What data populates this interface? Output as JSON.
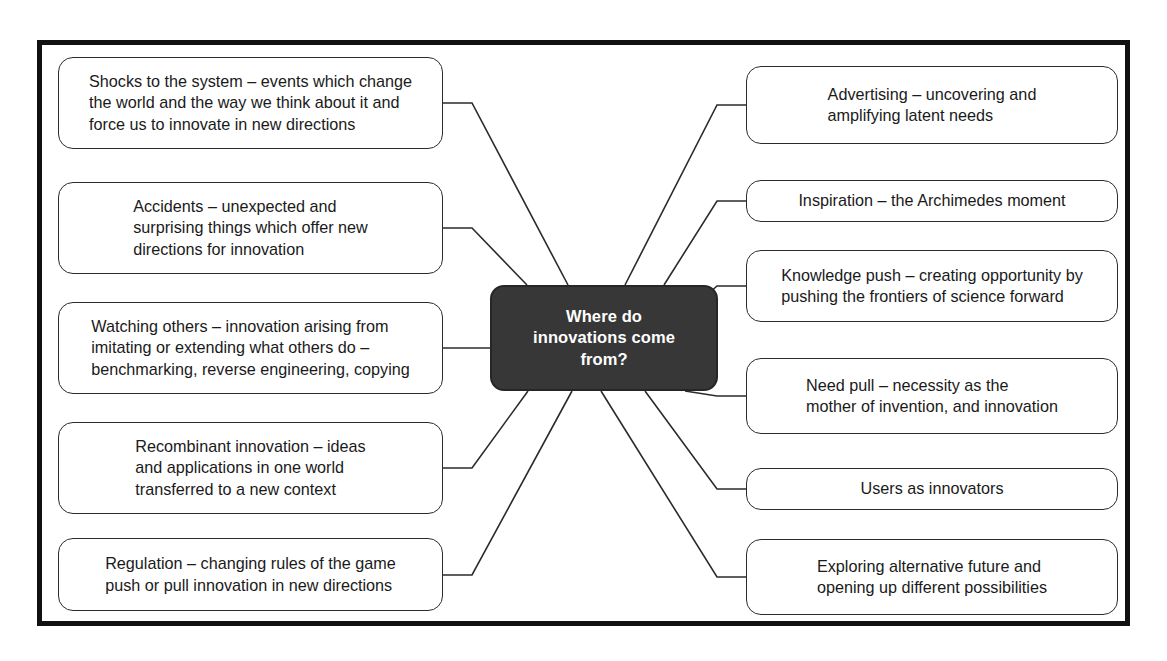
{
  "diagram": {
    "title": "Where do innovations come from?",
    "frame_color": "#111111",
    "node_border_color": "#2b2b2b",
    "center_fill_color": "#373737",
    "center_text_color": "#ffffff",
    "connector_color": "#2b2b2b"
  },
  "center": {
    "label": "Where do\ninnovations come\nfrom?"
  },
  "left_nodes": [
    {
      "id": "shocks-to-the-system",
      "label": "Shocks to the system – events which change\nthe world and the way we think about it and\nforce us to innovate in new directions",
      "align": "left"
    },
    {
      "id": "accidents",
      "label": "Accidents – unexpected and\nsurprising things which offer new\ndirections for innovation",
      "align": "left"
    },
    {
      "id": "watching-others",
      "label": "Watching others – innovation arising from\nimitating or extending what others do –\nbenchmarking, reverse engineering, copying",
      "align": "left"
    },
    {
      "id": "recombinant-innovation",
      "label": "Recombinant innovation – ideas\nand applications in one world\ntransferred to a new context",
      "align": "left"
    },
    {
      "id": "regulation",
      "label": "Regulation – changing rules of the game\npush or pull innovation in new directions",
      "align": "left"
    }
  ],
  "right_nodes": [
    {
      "id": "advertising",
      "label": "Advertising – uncovering and\namplifying latent needs",
      "align": "left"
    },
    {
      "id": "inspiration",
      "label": "Inspiration – the Archimedes moment",
      "align": "center"
    },
    {
      "id": "knowledge-push",
      "label": "Knowledge push – creating opportunity by\npushing the frontiers of science forward",
      "align": "left"
    },
    {
      "id": "need-pull",
      "label": "Need pull – necessity as the\nmother of invention, and innovation",
      "align": "left"
    },
    {
      "id": "users-as-innovators",
      "label": "Users as innovators",
      "align": "center"
    },
    {
      "id": "exploring-alternative-futures",
      "label": "Exploring alternative future and\nopening up different possibilities",
      "align": "left"
    }
  ],
  "layout": {
    "left_boxes": [
      {
        "x": 58,
        "y": 57,
        "w": 385,
        "h": 92
      },
      {
        "x": 58,
        "y": 182,
        "w": 385,
        "h": 92
      },
      {
        "x": 58,
        "y": 302,
        "w": 385,
        "h": 92
      },
      {
        "x": 58,
        "y": 422,
        "w": 385,
        "h": 92
      },
      {
        "x": 58,
        "y": 538,
        "w": 385,
        "h": 73
      }
    ],
    "right_boxes": [
      {
        "x": 746,
        "y": 66,
        "w": 372,
        "h": 78
      },
      {
        "x": 746,
        "y": 180,
        "w": 372,
        "h": 42
      },
      {
        "x": 746,
        "y": 250,
        "w": 372,
        "h": 72
      },
      {
        "x": 746,
        "y": 358,
        "w": 372,
        "h": 76
      },
      {
        "x": 746,
        "y": 468,
        "w": 372,
        "h": 42
      },
      {
        "x": 746,
        "y": 539,
        "w": 372,
        "h": 76
      }
    ],
    "center_box": {
      "x": 490,
      "y": 285,
      "w": 228,
      "h": 106
    }
  }
}
